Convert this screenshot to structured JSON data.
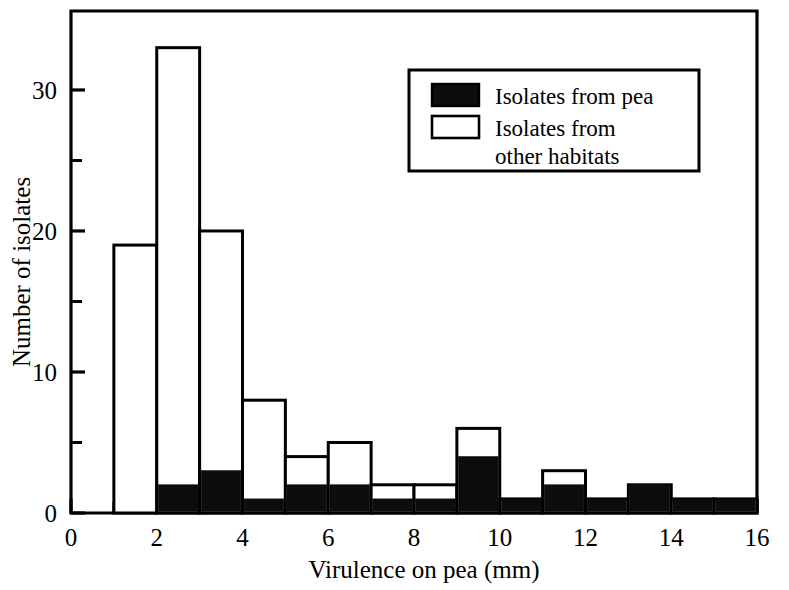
{
  "chart_data": {
    "type": "bar",
    "title": "",
    "subtitle": "",
    "xlabel": "Virulence on pea (mm)",
    "ylabel": "Number of isolates",
    "xlim": [
      0,
      16
    ],
    "ylim": [
      0,
      35
    ],
    "grid": false,
    "bin_width": 1,
    "bin_starts": [
      0,
      1,
      2,
      3,
      4,
      5,
      6,
      7,
      8,
      9,
      10,
      11,
      12,
      13,
      14,
      15
    ],
    "bin_labels": [
      "0-1",
      "1-2",
      "2-3",
      "3-4",
      "4-5",
      "5-6",
      "6-7",
      "7-8",
      "8-9",
      "9-10",
      "10-11",
      "11-12",
      "12-13",
      "13-14",
      "14-15",
      "15-16"
    ],
    "stacked": true,
    "series": [
      {
        "name": "Isolates from pea",
        "color": "#0d0d0d",
        "values": [
          0,
          0,
          2,
          3,
          1,
          2,
          2,
          1,
          1,
          4,
          1,
          2,
          1,
          2,
          1,
          1
        ]
      },
      {
        "name": "Isolates from other habitats",
        "color": "#ffffff",
        "values": [
          0,
          19,
          31,
          17,
          7,
          2,
          3,
          1,
          1,
          2,
          0,
          1,
          0,
          0,
          0,
          0
        ]
      }
    ],
    "totals": [
      0,
      19,
      33,
      20,
      8,
      4,
      5,
      2,
      2,
      6,
      1,
      3,
      1,
      2,
      1,
      1
    ],
    "x_ticks": [
      0,
      2,
      4,
      6,
      8,
      10,
      12,
      14,
      16
    ],
    "x_tick_labels": [
      "0",
      "2",
      "4",
      "6",
      "8",
      "10",
      "12",
      "14",
      "16"
    ],
    "x_minor_ticks": [
      1,
      3,
      5,
      7,
      9,
      11,
      13,
      15
    ],
    "y_ticks": [
      0,
      10,
      20,
      30
    ],
    "y_tick_labels": [
      "0",
      "10",
      "20",
      "30"
    ],
    "y_minor_ticks": [
      5,
      15,
      25
    ],
    "legend_position": "top-right"
  },
  "legend": {
    "entries": [
      {
        "label": "Isolates from pea",
        "swatch": "filled"
      },
      {
        "label": "Isolates from",
        "label2": "other habitats",
        "swatch": "open"
      }
    ]
  }
}
